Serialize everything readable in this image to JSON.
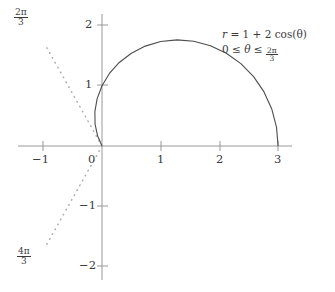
{
  "chart_data": {
    "type": "line",
    "title": "",
    "subtitle": "",
    "equation_label": "r = 1 + 2cos(θ)",
    "domain_label": "0 ≤ θ ≤ 2π/3",
    "xlabel": "",
    "ylabel": "",
    "xlim": [
      -1.7,
      3.6
    ],
    "ylim": [
      -2.3,
      2.35
    ],
    "xticks": [
      "−1",
      "0",
      "1",
      "2",
      "3"
    ],
    "xtick_values": [
      -1,
      0,
      1,
      2,
      3
    ],
    "yticks": [
      "2",
      "1",
      "−1",
      "−2"
    ],
    "ytick_values": [
      2,
      1,
      -1,
      -2
    ],
    "grid": false,
    "legend": "none",
    "polar_equation": {
      "r_const": 1,
      "r_cos_coeff": 2,
      "theta_min": 0,
      "theta_max_pi_frac": "2/3"
    },
    "series": [
      {
        "name": "limacon-r-1-plus-2cos-theta",
        "style": "solid",
        "color": "#4d4d4d",
        "theta_deg": [
          0,
          6,
          12,
          18,
          24,
          30,
          36,
          42,
          48,
          54,
          60,
          66,
          72,
          78,
          84,
          90,
          96,
          102,
          108,
          114,
          120
        ],
        "r": [
          3.0,
          2.989,
          2.956,
          2.902,
          2.827,
          2.732,
          2.618,
          2.486,
          2.339,
          2.176,
          2.0,
          1.813,
          1.618,
          1.416,
          1.209,
          1.0,
          0.791,
          0.584,
          0.382,
          0.187,
          0.0
        ],
        "x": [
          3.0,
          2.973,
          2.892,
          2.761,
          2.582,
          2.366,
          2.118,
          1.848,
          1.565,
          1.279,
          1.0,
          0.737,
          0.5,
          0.294,
          0.126,
          0.0,
          -0.083,
          -0.121,
          -0.118,
          -0.076,
          0.0
        ],
        "y": [
          0.0,
          0.312,
          0.615,
          0.897,
          1.15,
          1.366,
          1.539,
          1.663,
          1.738,
          1.76,
          1.732,
          1.656,
          1.539,
          1.385,
          1.202,
          1.0,
          0.787,
          0.571,
          0.363,
          0.171,
          0.0
        ]
      }
    ],
    "rays": [
      {
        "name": "ray-2pi-over-3",
        "angle_deg": 120,
        "style": "dotted",
        "label": "2π/3",
        "label_num": "2π",
        "label_den": "3",
        "color": "#b0b0b0"
      },
      {
        "name": "ray-4pi-over-3",
        "angle_deg": 240,
        "style": "dotted",
        "label": "4π/3",
        "label_num": "4π",
        "label_den": "3",
        "color": "#b0b0b0"
      }
    ],
    "axis_color": "#999999",
    "curve_color": "#4d4d4d",
    "text_color": "#3a3a3a",
    "background": "#ffffff"
  },
  "annotation": {
    "r_prefix": "r",
    "equals": "=",
    "rhs": "1 + 2 cos(θ)",
    "theta_lower": "0",
    "le1": "≤",
    "theta_sym": "θ",
    "le2": "≤",
    "frac_num": "2π",
    "frac_den": "3"
  },
  "ticks": {
    "x": [
      {
        "label": "−1",
        "value": -1
      },
      {
        "label": "0",
        "value": 0
      },
      {
        "label": "1",
        "value": 1
      },
      {
        "label": "2",
        "value": 2
      },
      {
        "label": "3",
        "value": 3
      }
    ],
    "y": [
      {
        "label": "2",
        "value": 2
      },
      {
        "label": "1",
        "value": 1
      },
      {
        "label": "−1",
        "value": -1
      },
      {
        "label": "−2",
        "value": -2
      }
    ]
  },
  "angle_labels": {
    "upper": {
      "num": "2π",
      "den": "3"
    },
    "lower": {
      "num": "4π",
      "den": "3"
    }
  }
}
